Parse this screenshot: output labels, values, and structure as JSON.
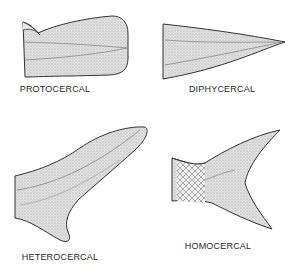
{
  "figure": {
    "panels": [
      {
        "id": "protocercal",
        "label": "PROTOCERCAL"
      },
      {
        "id": "diphycercal",
        "label": "DIPHYCERCAL"
      },
      {
        "id": "heterocercal",
        "label": "HETEROCERCAL"
      },
      {
        "id": "homocercal",
        "label": "HOMOCERCAL"
      }
    ]
  },
  "colors": {
    "fin_fill": "#dcdcdc",
    "outline": "#333333",
    "background": "#ffffff"
  }
}
